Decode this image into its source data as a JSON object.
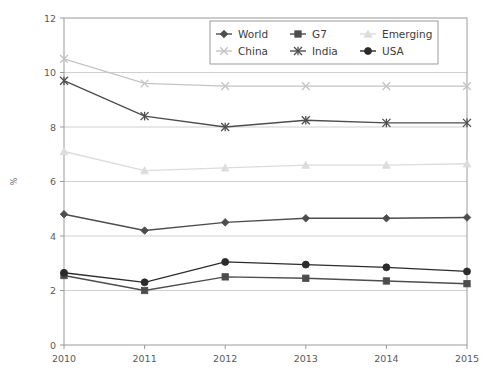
{
  "chart_data": {
    "type": "line",
    "title": "",
    "xlabel": "",
    "ylabel": "%",
    "categories": [
      "2010",
      "2011",
      "2012",
      "2013",
      "2014",
      "2015"
    ],
    "x": [
      2010,
      2011,
      2012,
      2013,
      2014,
      2015
    ],
    "xlim": [
      2010,
      2015
    ],
    "ylim": [
      0,
      12
    ],
    "yticks": [
      0,
      2,
      4,
      6,
      8,
      10,
      12
    ],
    "xticks": [
      "2010",
      "2011",
      "2012",
      "2013",
      "2014",
      "2015"
    ],
    "grid": "horizontal",
    "legend_position": "top-center",
    "series": [
      {
        "name": "World",
        "values": [
          4.8,
          4.2,
          4.5,
          4.65,
          4.65,
          4.68
        ],
        "color": "#4d4d4d",
        "marker": "diamond"
      },
      {
        "name": "G7",
        "values": [
          2.55,
          2.0,
          2.5,
          2.45,
          2.35,
          2.25
        ],
        "color": "#4d4d4d",
        "marker": "square"
      },
      {
        "name": "Emerging",
        "values": [
          7.1,
          6.4,
          6.5,
          6.6,
          6.6,
          6.65
        ],
        "color": "#dcdcdc",
        "marker": "triangle"
      },
      {
        "name": "China",
        "values": [
          10.5,
          9.6,
          9.5,
          9.5,
          9.5,
          9.5
        ],
        "color": "#c4c4c4",
        "marker": "cross"
      },
      {
        "name": "India",
        "values": [
          9.7,
          8.4,
          8.0,
          8.25,
          8.15,
          8.15
        ],
        "color": "#4d4d4d",
        "marker": "asterisk"
      },
      {
        "name": "USA",
        "values": [
          2.65,
          2.3,
          3.05,
          2.95,
          2.85,
          2.7
        ],
        "color": "#2b2b2b",
        "marker": "circle"
      }
    ]
  },
  "legend": {
    "items": [
      {
        "label": "World"
      },
      {
        "label": "G7"
      },
      {
        "label": "Emerging"
      },
      {
        "label": "China"
      },
      {
        "label": "India"
      },
      {
        "label": "USA"
      }
    ]
  },
  "axes": {
    "y_title": "%",
    "y_tick_labels": [
      "0",
      "2",
      "4",
      "6",
      "8",
      "10",
      "12"
    ],
    "x_tick_labels": [
      "2010",
      "2011",
      "2012",
      "2013",
      "2014",
      "2015"
    ]
  }
}
